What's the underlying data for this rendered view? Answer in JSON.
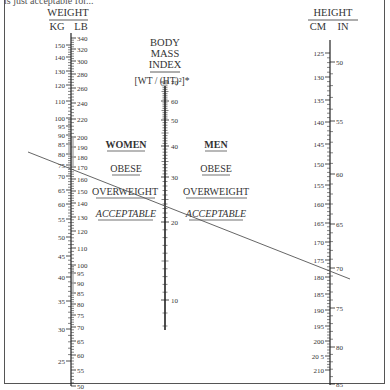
{
  "caption_fragment": "is just acceptable for...",
  "weight": {
    "title": "WEIGHT",
    "kg_label": "KG",
    "lb_label": "LB",
    "kg_ticks": [
      {
        "v": "150",
        "y": 45
      },
      {
        "v": "140",
        "y": 57
      },
      {
        "v": "130",
        "y": 71
      },
      {
        "v": "120",
        "y": 85
      },
      {
        "v": "110",
        "y": 101
      },
      {
        "v": "100",
        "y": 118
      },
      {
        "v": "95",
        "y": 126
      },
      {
        "v": "90",
        "y": 135
      },
      {
        "v": "85",
        "y": 144
      },
      {
        "v": "80",
        "y": 154
      },
      {
        "v": "75",
        "y": 165
      },
      {
        "v": "70",
        "y": 176
      },
      {
        "v": "65",
        "y": 190
      },
      {
        "v": "60",
        "y": 204
      },
      {
        "v": "55",
        "y": 219
      },
      {
        "v": "50",
        "y": 237
      },
      {
        "v": "45",
        "y": 256
      },
      {
        "v": "40",
        "y": 277
      },
      {
        "v": "35",
        "y": 301
      },
      {
        "v": "30",
        "y": 329
      },
      {
        "v": "25",
        "y": 361
      }
    ],
    "lb_ticks": [
      {
        "v": "340",
        "y": 38
      },
      {
        "v": "320",
        "y": 49
      },
      {
        "v": "300",
        "y": 61
      },
      {
        "v": "280",
        "y": 74
      },
      {
        "v": "260",
        "y": 88
      },
      {
        "v": "240",
        "y": 103
      },
      {
        "v": "220",
        "y": 119
      },
      {
        "v": "200",
        "y": 137
      },
      {
        "v": "190",
        "y": 147
      },
      {
        "v": "180",
        "y": 157
      },
      {
        "v": "170",
        "y": 167
      },
      {
        "v": "160",
        "y": 179
      },
      {
        "v": "150",
        "y": 191
      },
      {
        "v": "140",
        "y": 203
      },
      {
        "v": "130",
        "y": 217
      },
      {
        "v": "120",
        "y": 231
      },
      {
        "v": "110",
        "y": 248
      },
      {
        "v": "100",
        "y": 265
      },
      {
        "v": "95",
        "y": 273
      },
      {
        "v": "90",
        "y": 283
      },
      {
        "v": "85",
        "y": 293
      },
      {
        "v": "80",
        "y": 304
      },
      {
        "v": "75",
        "y": 315
      },
      {
        "v": "70",
        "y": 327
      },
      {
        "v": "65",
        "y": 341
      },
      {
        "v": "60",
        "y": 355
      },
      {
        "v": "55",
        "y": 370
      },
      {
        "v": "50",
        "y": 386
      }
    ]
  },
  "bmi": {
    "title_lines": [
      "BODY",
      "MASS",
      "INDEX"
    ],
    "formula": "[WT / (HT)²]*",
    "ticks": [
      {
        "v": "70",
        "y": 82
      },
      {
        "v": "60",
        "y": 101
      },
      {
        "v": "50",
        "y": 120
      },
      {
        "v": "40",
        "y": 146
      },
      {
        "v": "30",
        "y": 177
      },
      {
        "v": "20",
        "y": 222
      },
      {
        "v": "10",
        "y": 300
      }
    ]
  },
  "categories": {
    "women": {
      "title": "WOMEN",
      "obese": "OBESE",
      "overweight": "OVERWEIGHT",
      "acceptable": "ACCEPTABLE"
    },
    "men": {
      "title": "MEN",
      "obese": "OBESE",
      "overweight": "OVERWEIGHT",
      "acceptable": "ACCEPTABLE"
    }
  },
  "height": {
    "title": "HEIGHT",
    "cm_label": "CM",
    "in_label": "IN",
    "cm_ticks": [
      {
        "v": "125",
        "y": 53
      },
      {
        "v": "130",
        "y": 77
      },
      {
        "v": "135",
        "y": 100
      },
      {
        "v": "140",
        "y": 122
      },
      {
        "v": "145",
        "y": 144
      },
      {
        "v": "150",
        "y": 164
      },
      {
        "v": "155",
        "y": 185
      },
      {
        "v": "160",
        "y": 204
      },
      {
        "v": "165",
        "y": 223
      },
      {
        "v": "170",
        "y": 242
      },
      {
        "v": "175",
        "y": 260
      },
      {
        "v": "180",
        "y": 277
      },
      {
        "v": "185",
        "y": 294
      },
      {
        "v": "190",
        "y": 310
      },
      {
        "v": "195",
        "y": 326
      },
      {
        "v": "200",
        "y": 341
      },
      {
        "v": "20 5",
        "y": 356
      },
      {
        "v": "210",
        "y": 370
      }
    ],
    "in_ticks": [
      {
        "v": "50",
        "y": 62
      },
      {
        "v": "55",
        "y": 121
      },
      {
        "v": "60",
        "y": 174
      },
      {
        "v": "65",
        "y": 224
      },
      {
        "v": "70",
        "y": 268
      },
      {
        "v": "75",
        "y": 308
      },
      {
        "v": "80",
        "y": 347
      },
      {
        "v": "85",
        "y": 384
      }
    ]
  },
  "example_line": {
    "x1": 28,
    "y1": 152,
    "x2": 350,
    "y2": 279,
    "color": "#555555"
  }
}
